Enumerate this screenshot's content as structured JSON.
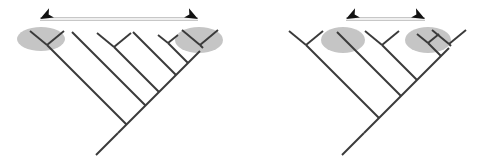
{
  "figure": {
    "type": "diagram",
    "background_color": "#ffffff",
    "width": 490,
    "height": 165,
    "branch_color": "#3a3a3a",
    "branch_width": 1.9,
    "highlight_color": "#c2c2c2",
    "highlight_opacity": 0.95,
    "arrow_line_color": "#efefef",
    "arrow_line_outline": "#b5b5b5",
    "arrow_head_color": "#111111"
  },
  "panels": [
    {
      "id": "left-tree",
      "name": "left-cladogram",
      "caption": "",
      "root": {
        "x": 118,
        "y": 133,
        "tail_x": 96,
        "tail_y": 155
      },
      "spine": [
        {
          "x": 118,
          "y": 133
        },
        {
          "x": 200,
          "y": 51
        }
      ],
      "highlights": [
        {
          "id": "left-tree-highlight-a",
          "cx": 41,
          "cy": 39,
          "rx": 24,
          "ry": 12,
          "rotate": 0
        },
        {
          "id": "left-tree-highlight-b",
          "cx": 199,
          "cy": 40,
          "rx": 24,
          "ry": 13,
          "rotate": 0
        }
      ],
      "clades": [
        {
          "id": "clade-1",
          "kind": "cherry",
          "apex_x": 47,
          "apex_y": 45,
          "span": 17,
          "depth": 14
        },
        {
          "id": "clade-2",
          "kind": "single",
          "apex_x": 72,
          "apex_y": 32,
          "span": 0,
          "depth": 0
        },
        {
          "id": "clade-3",
          "kind": "cherry",
          "apex_x": 114,
          "apex_y": 47,
          "span": 17,
          "depth": 14
        },
        {
          "id": "clade-4",
          "kind": "single",
          "apex_x": 133,
          "apex_y": 32,
          "span": 0,
          "depth": 0
        },
        {
          "id": "clade-5",
          "kind": "small-cherry",
          "apex_x": 168,
          "apex_y": 43,
          "span": 10,
          "depth": 8
        },
        {
          "id": "clade-6",
          "kind": "cherry",
          "apex_x": 200,
          "apex_y": 45,
          "span": 18,
          "depth": 15
        }
      ],
      "arrow": {
        "id": "left-tree-arrow",
        "from_x": 40,
        "from_y": 19,
        "to_x": 198,
        "to_y": 19,
        "double_headed": true,
        "head_tilt_deg": 28
      }
    },
    {
      "id": "right-tree",
      "name": "right-cladogram",
      "caption": "",
      "root": {
        "x": 364,
        "y": 133,
        "tail_x": 342,
        "tail_y": 155
      },
      "spine": [
        {
          "x": 364,
          "y": 133
        },
        {
          "x": 449,
          "y": 48
        }
      ],
      "highlights": [
        {
          "id": "right-tree-highlight-a",
          "cx": 343,
          "cy": 40,
          "rx": 22,
          "ry": 13,
          "rotate": 0
        },
        {
          "id": "right-tree-highlight-b",
          "cx": 428,
          "cy": 40,
          "rx": 23,
          "ry": 13,
          "rotate": 0
        }
      ],
      "clades": [
        {
          "id": "clade-1",
          "kind": "cherry",
          "apex_x": 306,
          "apex_y": 45,
          "span": 17,
          "depth": 14
        },
        {
          "id": "clade-2",
          "kind": "single",
          "apex_x": 337,
          "apex_y": 32,
          "span": 0,
          "depth": 0
        },
        {
          "id": "clade-3",
          "kind": "cherry",
          "apex_x": 382,
          "apex_y": 45,
          "span": 17,
          "depth": 14
        },
        {
          "id": "clade-4",
          "kind": "small-cherry",
          "apex_x": 428,
          "apex_y": 43,
          "span": 11,
          "depth": 9
        },
        {
          "id": "clade-5",
          "kind": "cherry",
          "apex_x": 449,
          "apex_y": 44,
          "span": 17,
          "depth": 14
        }
      ],
      "arrow": {
        "id": "right-tree-arrow",
        "from_x": 346,
        "from_y": 19,
        "to_x": 425,
        "to_y": 19,
        "double_headed": true,
        "head_tilt_deg": 28
      }
    }
  ]
}
